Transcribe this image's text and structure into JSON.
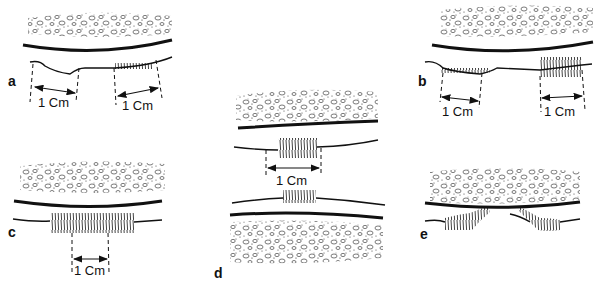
{
  "figure": {
    "panels": [
      {
        "id": "a",
        "letter": "a",
        "measure_labels": [
          "1 Cm",
          "1 Cm"
        ]
      },
      {
        "id": "b",
        "letter": "b",
        "measure_labels": [
          "1 Cm",
          "1 Cm"
        ]
      },
      {
        "id": "c",
        "letter": "c",
        "measure_labels": [
          "1 Cm"
        ]
      },
      {
        "id": "d",
        "letter": "d",
        "measure_labels": [
          "1 Cm"
        ]
      },
      {
        "id": "e",
        "letter": "e",
        "measure_labels": []
      }
    ]
  },
  "colors": {
    "ink": "#111111",
    "background": "#ffffff"
  }
}
